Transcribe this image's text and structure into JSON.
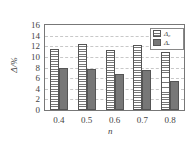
{
  "chart_data": {
    "type": "bar",
    "title": "",
    "xlabel": "n",
    "ylabel": "Δ/%",
    "categories": [
      "0.4",
      "0.5",
      "0.6",
      "0.7",
      "0.8"
    ],
    "series": [
      {
        "name": "Δ₀",
        "pattern": "horizontal-striped",
        "values": [
          11.5,
          12.4,
          11.3,
          12.2,
          11.0
        ]
      },
      {
        "name": "Δₑ",
        "pattern": "solid-gray",
        "values": [
          8.0,
          7.7,
          6.8,
          7.5,
          5.5
        ]
      }
    ],
    "ylim": [
      0,
      16
    ],
    "yticks": [
      0,
      2,
      4,
      6,
      8,
      10,
      12,
      14,
      16
    ],
    "grid": true,
    "legend_position": "upper right"
  },
  "labels": {
    "xlabel": "n",
    "ylabel": "Δ/%",
    "legend": [
      "Δ₀",
      "Δₑ"
    ],
    "yticks": [
      "16",
      "14",
      "12",
      "10",
      "8",
      "6",
      "4",
      "2",
      "0"
    ],
    "xticks": [
      "0.4",
      "0.5",
      "0.6",
      "0.7",
      "0.8"
    ]
  },
  "colors": {
    "dark_bar": "#777777",
    "stripe": "#777777",
    "axis": "#777777"
  }
}
